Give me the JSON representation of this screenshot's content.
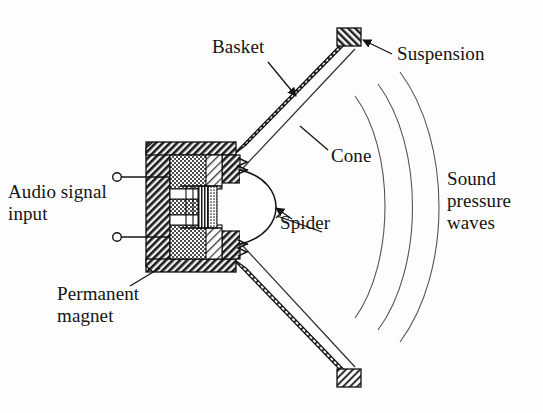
{
  "figure": {
    "background_color": "#fdfdfd",
    "ink_color": "#141414"
  },
  "labels": {
    "basket": "Basket",
    "suspension": "Suspension",
    "cone": "Cone",
    "spider": "Spider",
    "audio_signal_input": "Audio signal\ninput",
    "permanent_magnet": "Permanent\nmagnet",
    "sound_pressure_waves": "Sound\npressure\nwaves"
  },
  "parts": {
    "basket_upper_arm": "basket-upper-arm",
    "basket_lower_arm": "basket-lower-arm",
    "suspension_block_upper": "suspension-block-upper",
    "suspension_block_lower": "suspension-block-lower",
    "cone_upper": "cone-upper",
    "cone_lower": "cone-lower",
    "spider_upper": "spider-upper",
    "spider_lower": "spider-lower",
    "dust_cap_dome": "dust-cap-dome",
    "voice_coil": "voice-coil",
    "pole_piece": "pole-piece",
    "permanent_magnet_body": "permanent-magnet-body",
    "top_plate": "top-plate",
    "bottom_plate": "bottom-plate",
    "terminal_upper": "terminal-upper",
    "terminal_lower": "terminal-lower",
    "sound_wave_arc_1": "sound-wave-arc-1",
    "sound_wave_arc_2": "sound-wave-arc-2",
    "sound_wave_arc_3": "sound-wave-arc-3"
  },
  "leader_lines": {
    "basket": "arrow from Basket text down-right to upper basket arm",
    "suspension": "arrow from Suspension text left to suspension block",
    "cone": "line from Cone text up-left to upper cone membrane",
    "spider": "line from Spider text up-left to dust cap / spider junction",
    "permanent_magnet": "line from Permanent magnet text up-right to magnet body"
  }
}
